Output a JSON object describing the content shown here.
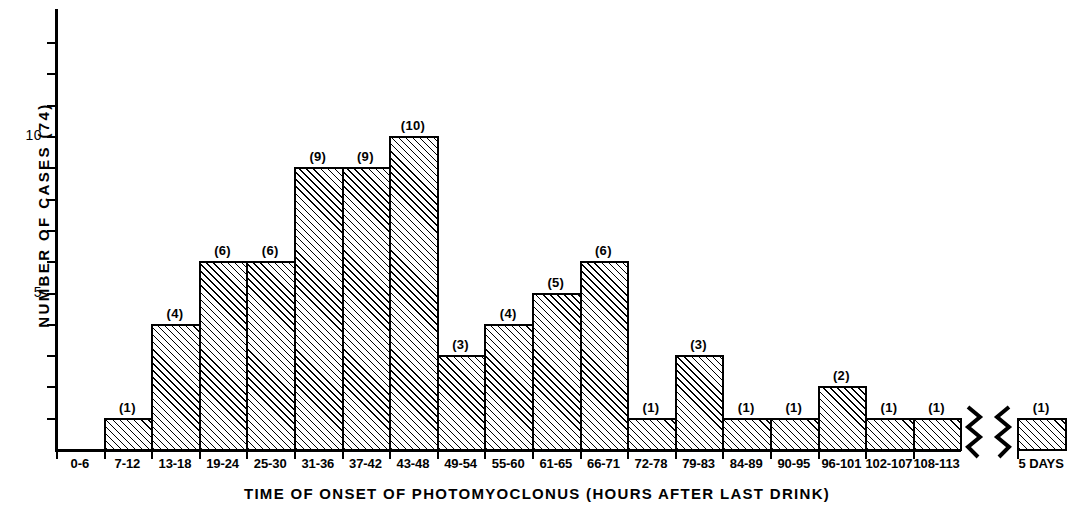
{
  "chart_data": {
    "type": "bar",
    "title": "",
    "xlabel": "TIME OF ONSET OF PHOTOMYOCLONUS (HOURS AFTER LAST DRINK)",
    "ylabel": "NUMBER OF CASES (74)",
    "categories": [
      "0-6",
      "7-12",
      "13-18",
      "19-24",
      "25-30",
      "31-36",
      "37-42",
      "43-48",
      "49-54",
      "55-60",
      "61-65",
      "66-71",
      "72-78",
      "79-83",
      "84-89",
      "90-95",
      "96-101",
      "102-107",
      "108-113",
      "5 DAYS"
    ],
    "values": [
      0,
      1,
      4,
      6,
      6,
      9,
      9,
      10,
      3,
      4,
      5,
      6,
      1,
      3,
      1,
      1,
      2,
      1,
      1,
      1
    ],
    "bar_labels": [
      "",
      "(1)",
      "(4)",
      "(6)",
      "(6)",
      "(9)",
      "(9)",
      "(10)",
      "(3)",
      "(4)",
      "(5)",
      "(6)",
      "(1)",
      "(3)",
      "(1)",
      "(1)",
      "(2)",
      "(1)",
      "(1)",
      "(1)"
    ],
    "ytick_values": [
      5,
      10
    ],
    "ytick_labels": [
      "5",
      "10"
    ],
    "ylim": [
      0,
      14
    ],
    "grid": false,
    "legend": null,
    "axis_break": {
      "present": true,
      "after_category": "108-113",
      "before_category": "5 DAYS"
    },
    "bar_fill": "diagonal-hatch",
    "total_cases": 74,
    "color": "#000000"
  },
  "figure": {
    "y_axis_title": "NUMBER OF CASES (74)",
    "x_axis_title": "TIME OF ONSET OF PHOTOMYOCLONUS (HOURS AFTER LAST DRINK)"
  }
}
